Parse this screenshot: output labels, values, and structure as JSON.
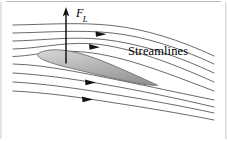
{
  "figure": {
    "background_color": "#ffffff",
    "width": 227,
    "height": 141,
    "labels": {
      "streamlines": "Streamlines",
      "force_symbol": "F",
      "force_subscript": "L"
    },
    "colors": {
      "streamline_stroke": "#4d4d4d",
      "airfoil_fill_light": "#c9c9c9",
      "airfoil_fill_dark": "#9a9a9a",
      "airfoil_stroke": "#6b6b6b",
      "arrow_color": "#1a1a1a",
      "text_color": "#000000",
      "border_color": "#b8b8b8"
    },
    "airfoil": {
      "name": "airfoil-cross-section",
      "leading_edge": [
        38,
        58
      ],
      "trailing_edge": [
        157,
        85
      ],
      "chord_angle_deg": 13
    },
    "force_vector": {
      "name": "lift-force-vector",
      "tail": [
        66,
        63
      ],
      "tip": [
        66,
        8
      ],
      "direction": "up"
    },
    "streamlines": {
      "count": 9,
      "flow_direction": "left-to-right",
      "arrowhead_count": 4
    }
  }
}
